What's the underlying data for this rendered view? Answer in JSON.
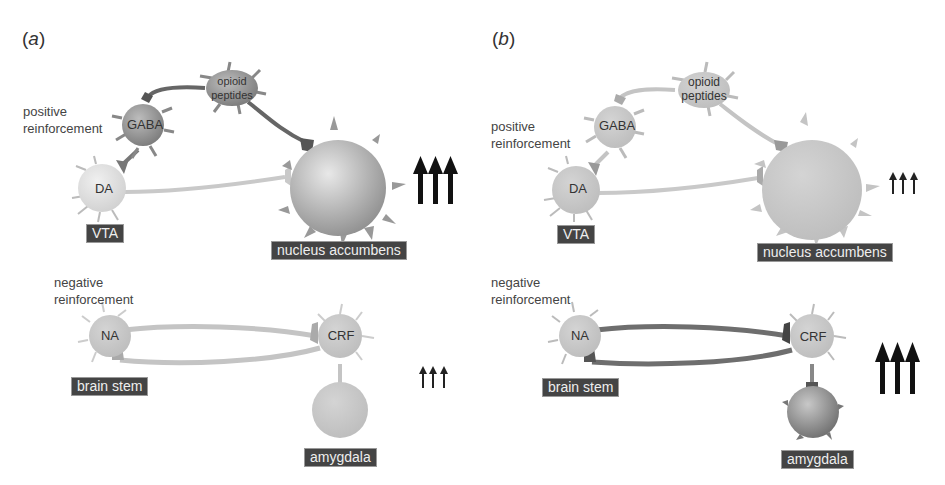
{
  "figure": {
    "panels": [
      {
        "id": "a",
        "label_open": "(",
        "label_letter": "a",
        "label_close": ")",
        "positive": {
          "section_label_line1": "positive",
          "section_label_line2": "reinforcement",
          "cells": {
            "opioid_line1": "opioid",
            "opioid_line2": "peptides",
            "gaba": "GABA",
            "da": "DA"
          },
          "regions": {
            "vta": "VTA",
            "nacc": "nucleus accumbens"
          },
          "arrow_size": "large",
          "arrow_count": 3
        },
        "negative": {
          "section_label_line1": "negative",
          "section_label_line2": "reinforcement",
          "cells": {
            "na": "NA",
            "crf": "CRF"
          },
          "regions": {
            "brainstem": "brain stem",
            "amygdala": "amygdala"
          },
          "arrow_size": "small",
          "arrow_count": 3
        }
      },
      {
        "id": "b",
        "label_open": "(",
        "label_letter": "b",
        "label_close": ")",
        "positive": {
          "section_label_line1": "positive",
          "section_label_line2": "reinforcement",
          "cells": {
            "opioid_line1": "opioid",
            "opioid_line2": "peptides",
            "gaba": "GABA",
            "da": "DA"
          },
          "regions": {
            "vta": "VTA",
            "nacc": "nucleus accumbens"
          },
          "arrow_size": "small",
          "arrow_count": 3
        },
        "negative": {
          "section_label_line1": "negative",
          "section_label_line2": "reinforcement",
          "cells": {
            "na": "NA",
            "crf": "CRF"
          },
          "regions": {
            "brainstem": "brain stem",
            "amygdala": "amygdala"
          },
          "arrow_size": "large",
          "arrow_count": 3
        }
      }
    ],
    "colors": {
      "active_cell": "#8a8a8a",
      "inactive_cell": "#c4c4c4",
      "light_cell": "#dcdcdc",
      "active_axon": "#666666",
      "inactive_axon": "#bdbdbd",
      "terminal_dark": "#555555",
      "tag_bg": "#444444",
      "arrow": "#111111"
    }
  }
}
